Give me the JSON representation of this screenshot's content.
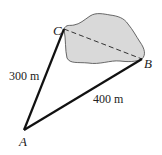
{
  "diagram": {
    "points": {
      "A": {
        "label": "A",
        "x": 24,
        "y": 130
      },
      "B": {
        "label": "B",
        "x": 142,
        "y": 59
      },
      "C": {
        "label": "C",
        "x": 64,
        "y": 29
      }
    },
    "sides": {
      "AC": {
        "label": "300 m"
      },
      "AB": {
        "label": "400 m"
      },
      "CB": {
        "label": "",
        "style": "dashed"
      }
    },
    "region": {
      "fill": "#d9d9d9",
      "stroke": "#444444"
    },
    "colors": {
      "line": "#111111"
    }
  }
}
